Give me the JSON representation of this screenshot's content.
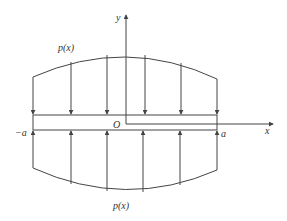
{
  "diagram": {
    "type": "plate-with-distributed-load",
    "labels": {
      "load_top": "p(x)",
      "load_bottom": "p(x)",
      "y_axis": "y",
      "x_axis": "x",
      "origin": "O",
      "left_end": "−a",
      "right_end": "a"
    },
    "colors": {
      "stroke": "#444444",
      "text": "#333333",
      "background": "#ffffff"
    }
  }
}
